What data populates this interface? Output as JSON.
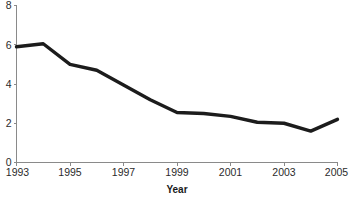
{
  "chart_data": {
    "type": "line",
    "title": "",
    "subtitle": "",
    "xlabel": "Year",
    "ylabel": "",
    "x": [
      1993,
      1994,
      1995,
      1996,
      1997,
      1998,
      1999,
      2000,
      2001,
      2002,
      2003,
      2004,
      2005
    ],
    "values": [
      5.9,
      6.05,
      5.0,
      4.7,
      3.95,
      3.2,
      2.55,
      2.5,
      2.35,
      2.05,
      2.0,
      1.6,
      2.2
    ],
    "series": [
      {
        "name": "rate",
        "values": [
          5.9,
          6.05,
          5.0,
          4.7,
          3.95,
          3.2,
          2.55,
          2.5,
          2.35,
          2.05,
          2.0,
          1.6,
          2.2
        ]
      }
    ],
    "xlim": [
      1993,
      2005
    ],
    "ylim": [
      0,
      8
    ],
    "x_tick_labels": [
      "1993",
      "1995",
      "1997",
      "1999",
      "2001",
      "2003",
      "2005"
    ],
    "x_tick_values": [
      1993,
      1995,
      1997,
      1999,
      2001,
      2003,
      2005
    ],
    "y_tick_labels": [
      "0",
      "2",
      "4",
      "6",
      "8"
    ],
    "y_tick_values": [
      0,
      2,
      4,
      6,
      8
    ],
    "grid": false,
    "legend": false,
    "legend_position": "none",
    "line_color": "#1c1c1c",
    "axis_color": "#8a8a8a",
    "background_color": "#ffffff",
    "annotations": []
  },
  "axis_titles": {
    "x": "Year"
  },
  "y_ticks": [
    {
      "label": "8",
      "value": 8
    },
    {
      "label": "6",
      "value": 6
    },
    {
      "label": "4",
      "value": 4
    },
    {
      "label": "2",
      "value": 2
    },
    {
      "label": "0",
      "value": 0
    }
  ],
  "x_ticks": [
    {
      "label": "1993",
      "value": 1993
    },
    {
      "label": "1995",
      "value": 1995
    },
    {
      "label": "1997",
      "value": 1997
    },
    {
      "label": "1999",
      "value": 1999
    },
    {
      "label": "2001",
      "value": 2001
    },
    {
      "label": "2003",
      "value": 2003
    },
    {
      "label": "2005",
      "value": 2005
    }
  ]
}
